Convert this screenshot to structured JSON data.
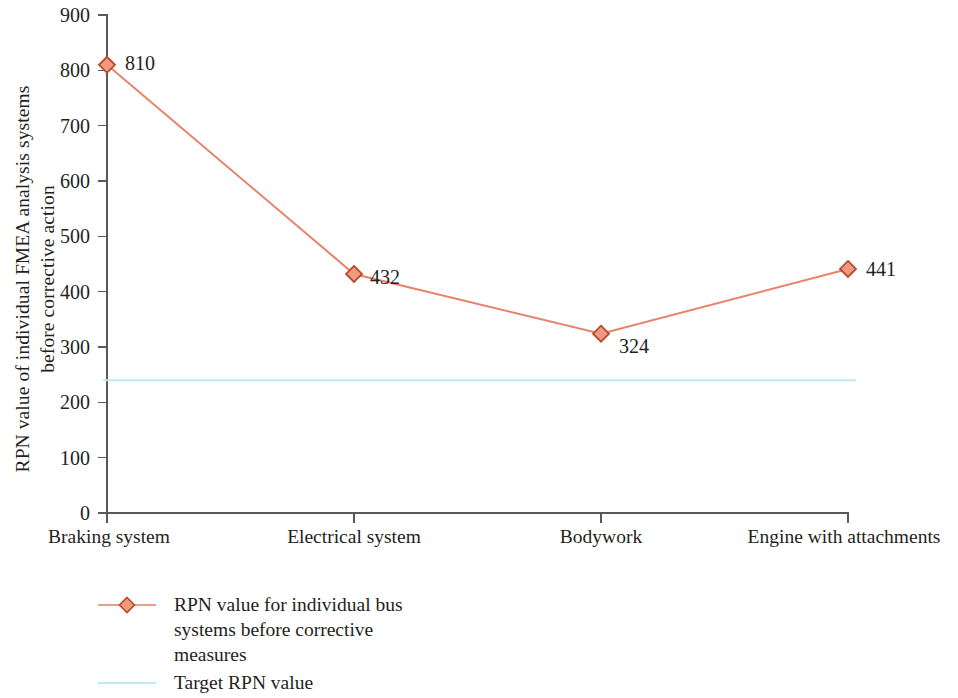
{
  "chart_data": {
    "type": "line",
    "title": "",
    "subtitle": "",
    "xlabel": "",
    "ylabel": "RPN value of individual FMEA analysis systems before corrective action",
    "ylabel_lines": [
      "RPN value of individual FMEA analysis systems",
      "before corrective action"
    ],
    "categories": [
      "Braking system",
      "Electrical system",
      "Bodywork",
      "Engine with attachments"
    ],
    "series": [
      {
        "name": "RPN value for individual bus systems before corrective measures",
        "type": "line",
        "marker": "diamond",
        "color": "#e8826a",
        "marker_fill": "#ef9a7f",
        "marker_stroke": "#b54a2e",
        "values": [
          810,
          432,
          324,
          441
        ],
        "point_labels": [
          "810",
          "432",
          "324",
          "441"
        ]
      },
      {
        "name": "Target RPN value",
        "type": "reference-line",
        "color": "#bfe9f2",
        "value": 240,
        "values": [
          240,
          240,
          240,
          240
        ]
      }
    ],
    "ylim": [
      0,
      900
    ],
    "ytick_step": 100,
    "yticks": [
      0,
      100,
      200,
      300,
      400,
      500,
      600,
      700,
      800,
      900
    ],
    "ytick_labels": [
      "0",
      "100",
      "200",
      "300",
      "400",
      "500",
      "600",
      "700",
      "800",
      "900"
    ],
    "grid": false,
    "legend_position": "bottom-left",
    "legend": [
      {
        "key": "line-diamond-marker",
        "color": "#e8826a",
        "lines": [
          "RPN value for individual bus",
          "systems before corrective",
          "measures"
        ]
      },
      {
        "key": "line-plain",
        "color": "#bfe9f2",
        "lines": [
          "Target RPN value"
        ]
      }
    ]
  }
}
